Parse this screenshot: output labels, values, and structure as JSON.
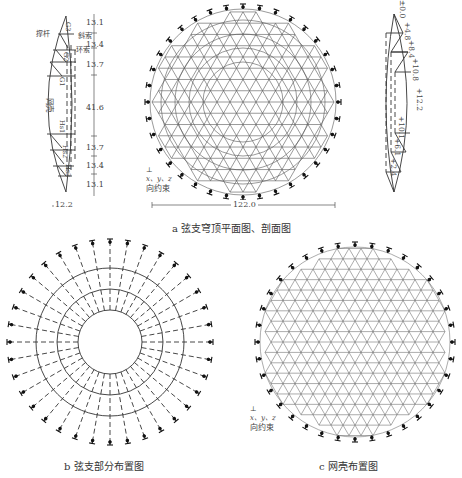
{
  "figure": {
    "panel_a": {
      "caption": "a  弦支穹顶平面图、剖面图",
      "span_label": "122.0",
      "left_section": {
        "labels": {
          "strut": "撑杆",
          "diagonal_cable": "斜索",
          "hoop_cable": "环索",
          "shell": "网壳"
        },
        "member_labels": [
          "G3",
          "G2",
          "G1",
          "Hs1",
          "Hs2",
          "Hs3"
        ],
        "radial_dims": [
          "13.1",
          "13.4",
          "13.7",
          "41.6",
          "13.7",
          "13.4",
          "13.1"
        ],
        "width_dim": "12.2"
      },
      "right_section": {
        "elevations": [
          "±0.0",
          "+4.8",
          "+8.4",
          "+10.8",
          "+12.2",
          "+10.1",
          "+6.1",
          "+2.4"
        ]
      },
      "constraint_note": {
        "axes": "x、y、z",
        "text": "向约束"
      }
    },
    "panel_b": {
      "caption": "b  弦支部分布置图",
      "spokes": 36,
      "rings": 3
    },
    "panel_c": {
      "caption": "c  网壳布置图",
      "constraint_note": {
        "axes": "x、y、z",
        "text": "向约束"
      }
    }
  }
}
